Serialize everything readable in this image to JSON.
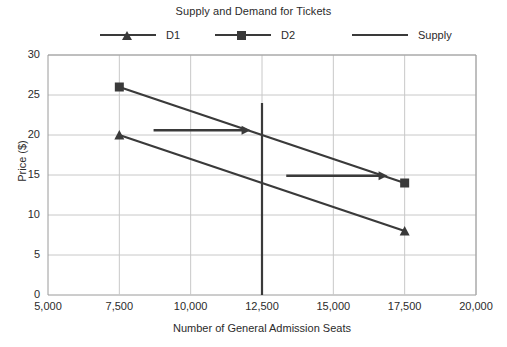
{
  "chart_data": {
    "type": "line",
    "title": "Supply and Demand for Tickets",
    "xlabel": "Number of General Admission Seats",
    "ylabel": "Price ($)",
    "xlim": [
      5000,
      20000
    ],
    "ylim": [
      0,
      30
    ],
    "xticks": [
      5000,
      7500,
      10000,
      12500,
      15000,
      17500,
      20000
    ],
    "xtick_labels": [
      "5,000",
      "7,500",
      "10,000",
      "12,500",
      "15,000",
      "17,500",
      "20,000"
    ],
    "yticks": [
      0,
      5,
      10,
      15,
      20,
      25,
      30
    ],
    "ytick_labels": [
      "0",
      "5",
      "10",
      "15",
      "20",
      "25",
      "30"
    ],
    "grid": true,
    "legend_position": "top",
    "line_color": "#3a3a3a",
    "grid_color": "#c8c8c8",
    "axis_color": "#9a9a9a",
    "background": "#ffffff",
    "series": [
      {
        "name": "D1",
        "marker": "triangle",
        "x": [
          7500,
          17500
        ],
        "y": [
          20,
          8
        ]
      },
      {
        "name": "D2",
        "marker": "square",
        "x": [
          7500,
          17500
        ],
        "y": [
          26,
          14
        ]
      },
      {
        "name": "Supply",
        "marker": "none",
        "x": [
          12500,
          12500
        ],
        "y": [
          0,
          24
        ]
      }
    ],
    "annotations": [
      {
        "name": "shift-arrow-upper",
        "type": "arrow",
        "x_start": 8700,
        "x_end": 12100,
        "y": 20.6
      },
      {
        "name": "shift-arrow-lower",
        "type": "arrow",
        "x_start": 13350,
        "x_end": 16900,
        "y": 14.9
      }
    ]
  },
  "legend": {
    "items": [
      {
        "label": "D1",
        "marker": "triangle"
      },
      {
        "label": "D2",
        "marker": "square"
      },
      {
        "label": "Supply",
        "marker": "none"
      }
    ]
  }
}
